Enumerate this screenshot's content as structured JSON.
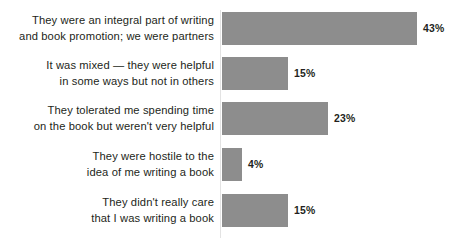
{
  "chart_data": {
    "type": "bar",
    "orientation": "horizontal",
    "title": "",
    "subtitle": "",
    "xlabel": "",
    "ylabel": "",
    "grid": false,
    "legend": null,
    "axis_line": true,
    "xlim": [
      0,
      43
    ],
    "value_suffix": "%",
    "bar_color": "#8d8d8d",
    "label_color": "#231f20",
    "value_label_color": "#231f20",
    "categories": [
      "They were an integral part of writing\nand book promotion; we were partners",
      "It was mixed — they were helpful\nin some ways but not in others",
      "They tolerated me spending time\non the book but weren't very helpful",
      "They were hostile to the\nidea of me writing a book",
      "They didn't really care\nthat I was writing a book"
    ],
    "values": [
      43,
      15,
      23,
      4,
      15
    ],
    "value_labels": [
      "43%",
      "15%",
      "23%",
      "4%",
      "15%"
    ],
    "bars": [
      {
        "label": "They were an integral part of writing\nand book promotion; we were partners",
        "value": 43,
        "value_label": "43%",
        "bar_width_px": 195,
        "row_top_px": 12,
        "row_height_px": 33
      },
      {
        "label": "It was mixed — they were helpful\nin some ways but not in others",
        "value": 15,
        "value_label": "15%",
        "bar_width_px": 66,
        "row_top_px": 57,
        "row_height_px": 33
      },
      {
        "label": "They tolerated me spending time\non the book but weren't very helpful",
        "value": 23,
        "value_label": "23%",
        "bar_width_px": 106,
        "row_top_px": 102,
        "row_height_px": 33
      },
      {
        "label": "They were hostile to the\nidea of me writing a book",
        "value": 4,
        "value_label": "4%",
        "bar_width_px": 20,
        "row_top_px": 148,
        "row_height_px": 33
      },
      {
        "label": "They didn't really care\nthat I was writing a book",
        "value": 15,
        "value_label": "15%",
        "bar_width_px": 66,
        "row_top_px": 194,
        "row_height_px": 33
      }
    ]
  }
}
